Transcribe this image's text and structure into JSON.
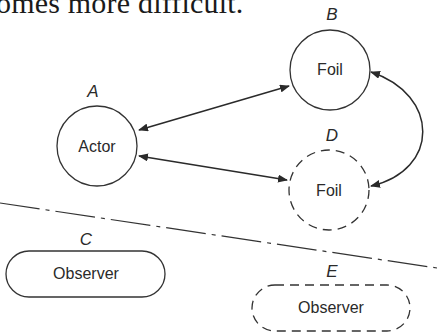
{
  "caption_fragment": "omes more difficult.",
  "nodes": {
    "A": {
      "letter": "A",
      "label": "Actor",
      "shape": "circle",
      "border": "solid"
    },
    "B": {
      "letter": "B",
      "label": "Foil",
      "shape": "circle",
      "border": "solid"
    },
    "D": {
      "letter": "D",
      "label": "Foil",
      "shape": "circle",
      "border": "dashed"
    },
    "C": {
      "letter": "C",
      "label": "Observer",
      "shape": "pill",
      "border": "solid"
    },
    "E": {
      "letter": "E",
      "label": "Observer",
      "shape": "pill",
      "border": "dashed"
    }
  },
  "edges": [
    {
      "from": "A",
      "to": "B",
      "type": "bidirectional-arrow"
    },
    {
      "from": "A",
      "to": "D",
      "type": "bidirectional-arrow"
    },
    {
      "from": "B",
      "to": "D",
      "type": "bidirectional-curved-arrow"
    }
  ],
  "separator": {
    "style": "dash-dot",
    "description": "divider between stage and observers"
  },
  "colors": {
    "stroke": "#333333",
    "text": "#2a2a2a",
    "background": "#ffffff"
  }
}
